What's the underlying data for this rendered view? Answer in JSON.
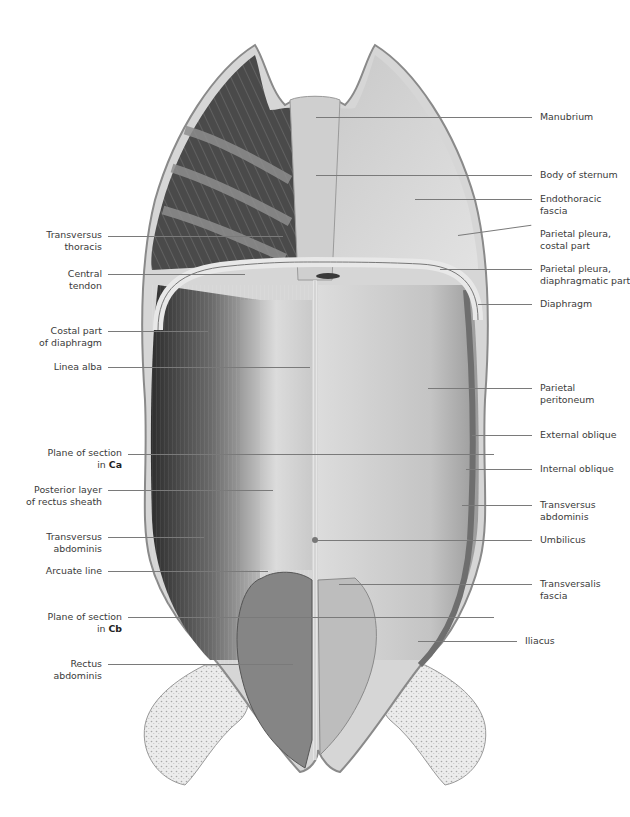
{
  "figure": {
    "colors": {
      "background": "#ffffff",
      "label_text": "#3a3a3a",
      "leader_line": "#7a7a7a",
      "tissue_dark": "#3c3c3c",
      "tissue_mid": "#8e8e8e",
      "tissue_light": "#d4d4d4"
    }
  },
  "labels_left": [
    {
      "id": "transversus-thoracis",
      "line1": "Transversus",
      "line2": "thoracis"
    },
    {
      "id": "central-tendon",
      "line1": "Central",
      "line2": "tendon"
    },
    {
      "id": "costal-part-diaphragm",
      "line1": "Costal part",
      "line2": "of diaphragm"
    },
    {
      "id": "linea-alba",
      "line1": "Linea alba",
      "line2": ""
    },
    {
      "id": "plane-ca",
      "line1": "Plane of section",
      "line2_prefix": "in ",
      "line2_bold": "Ca"
    },
    {
      "id": "posterior-rectus-sheath",
      "line1": "Posterior layer",
      "line2": "of rectus sheath"
    },
    {
      "id": "transversus-abdominis-left",
      "line1": "Transversus",
      "line2": "abdominis"
    },
    {
      "id": "arcuate-line",
      "line1": "Arcuate line",
      "line2": ""
    },
    {
      "id": "plane-cb",
      "line1": "Plane of section",
      "line2_prefix": "in ",
      "line2_bold": "Cb"
    },
    {
      "id": "rectus-abdominis",
      "line1": "Rectus",
      "line2": "abdominis"
    }
  ],
  "labels_right": [
    {
      "id": "manubrium",
      "line1": "Manubrium",
      "line2": ""
    },
    {
      "id": "body-of-sternum",
      "line1": "Body of sternum",
      "line2": ""
    },
    {
      "id": "endothoracic-fascia",
      "line1": "Endothoracic",
      "line2": "fascia"
    },
    {
      "id": "parietal-pleura-costal",
      "line1": "Parietal pleura,",
      "line2": "costal part"
    },
    {
      "id": "parietal-pleura-diaphragmatic",
      "line1": "Parietal pleura,",
      "line2": "diaphragmatic part"
    },
    {
      "id": "diaphragm",
      "line1": "Diaphragm",
      "line2": ""
    },
    {
      "id": "parietal-peritoneum",
      "line1": "Parietal",
      "line2": "peritoneum"
    },
    {
      "id": "external-oblique",
      "line1": "External oblique",
      "line2": ""
    },
    {
      "id": "internal-oblique",
      "line1": "Internal oblique",
      "line2": ""
    },
    {
      "id": "transversus-abdominis-right",
      "line1": "Transversus",
      "line2": "abdominis"
    },
    {
      "id": "umbilicus",
      "line1": "Umbilicus",
      "line2": ""
    },
    {
      "id": "transversalis-fascia",
      "line1": "Transversalis",
      "line2": "fascia"
    },
    {
      "id": "iliacus",
      "line1": "Iliacus",
      "line2": ""
    }
  ]
}
